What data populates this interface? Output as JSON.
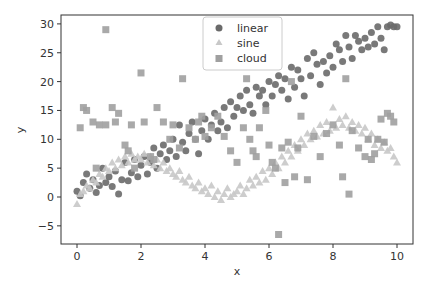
{
  "chart_data": {
    "type": "scatter",
    "title": "",
    "xlabel": "x",
    "ylabel": "y",
    "xlim": [
      -0.5,
      10.5
    ],
    "ylim": [
      -8,
      32
    ],
    "xticks": [
      0,
      2,
      4,
      6,
      8,
      10
    ],
    "yticks": [
      -5,
      0,
      5,
      10,
      15,
      20,
      25,
      30
    ],
    "grid": false,
    "legend_position": "upper center",
    "series": [
      {
        "name": "linear",
        "marker": "circle",
        "color": "#6a6a6a",
        "points": [
          [
            0.0,
            1.0
          ],
          [
            0.1,
            0.2
          ],
          [
            0.2,
            2.5
          ],
          [
            0.3,
            4.0
          ],
          [
            0.4,
            1.5
          ],
          [
            0.5,
            3.0
          ],
          [
            0.6,
            0.8
          ],
          [
            0.7,
            2.0
          ],
          [
            0.8,
            5.0
          ],
          [
            0.9,
            2.5
          ],
          [
            1.0,
            3.5
          ],
          [
            1.1,
            1.8
          ],
          [
            1.2,
            4.5
          ],
          [
            1.3,
            0.5
          ],
          [
            1.4,
            3.0
          ],
          [
            1.5,
            6.0
          ],
          [
            1.6,
            2.8
          ],
          [
            1.7,
            4.2
          ],
          [
            1.8,
            6.5
          ],
          [
            1.9,
            3.5
          ],
          [
            2.0,
            5.5
          ],
          [
            2.1,
            7.0
          ],
          [
            2.2,
            4.0
          ],
          [
            2.3,
            6.0
          ],
          [
            2.4,
            8.5
          ],
          [
            2.5,
            5.0
          ],
          [
            2.6,
            7.5
          ],
          [
            2.7,
            9.0
          ],
          [
            2.8,
            6.5
          ],
          [
            2.9,
            8.0
          ],
          [
            3.0,
            10.0
          ],
          [
            3.1,
            7.0
          ],
          [
            3.2,
            12.5
          ],
          [
            3.3,
            9.5
          ],
          [
            3.4,
            8.0
          ],
          [
            3.5,
            11.0
          ],
          [
            3.6,
            13.0
          ],
          [
            3.7,
            10.0
          ],
          [
            3.8,
            7.5
          ],
          [
            3.9,
            11.5
          ],
          [
            4.0,
            13.5
          ],
          [
            4.1,
            10.0
          ],
          [
            4.2,
            12.5
          ],
          [
            4.3,
            14.5
          ],
          [
            4.4,
            11.5
          ],
          [
            4.5,
            13.0
          ],
          [
            4.6,
            15.5
          ],
          [
            4.7,
            12.0
          ],
          [
            4.8,
            16.5
          ],
          [
            4.9,
            14.0
          ],
          [
            5.0,
            15.5
          ],
          [
            5.1,
            17.5
          ],
          [
            5.2,
            15.0
          ],
          [
            5.3,
            18.5
          ],
          [
            5.4,
            16.0
          ],
          [
            5.5,
            14.5
          ],
          [
            5.6,
            19.0
          ],
          [
            5.7,
            17.5
          ],
          [
            5.8,
            18.5
          ],
          [
            5.9,
            16.0
          ],
          [
            6.0,
            20.0
          ],
          [
            6.1,
            17.5
          ],
          [
            6.2,
            19.5
          ],
          [
            6.3,
            21.0
          ],
          [
            6.4,
            18.5
          ],
          [
            6.5,
            20.5
          ],
          [
            6.6,
            17.0
          ],
          [
            6.7,
            22.5
          ],
          [
            6.8,
            19.0
          ],
          [
            6.9,
            22.0
          ],
          [
            7.0,
            20.5
          ],
          [
            7.1,
            17.5
          ],
          [
            7.2,
            24.0
          ],
          [
            7.3,
            21.0
          ],
          [
            7.4,
            25.0
          ],
          [
            7.5,
            23.0
          ],
          [
            7.6,
            19.5
          ],
          [
            7.7,
            23.5
          ],
          [
            7.8,
            21.5
          ],
          [
            7.9,
            24.5
          ],
          [
            8.0,
            22.5
          ],
          [
            8.1,
            26.5
          ],
          [
            8.2,
            25.5
          ],
          [
            8.3,
            23.5
          ],
          [
            8.4,
            28.0
          ],
          [
            8.5,
            26.0
          ],
          [
            8.6,
            24.0
          ],
          [
            8.7,
            28.0
          ],
          [
            8.8,
            27.0
          ],
          [
            8.9,
            25.5
          ],
          [
            9.0,
            27.5
          ],
          [
            9.1,
            26.0
          ],
          [
            9.2,
            28.5
          ],
          [
            9.3,
            26.5
          ],
          [
            9.4,
            29.5
          ],
          [
            9.5,
            27.5
          ],
          [
            9.6,
            25.5
          ],
          [
            9.7,
            29.5
          ],
          [
            9.8,
            29.8
          ],
          [
            9.9,
            29.5
          ],
          [
            10.0,
            29.5
          ]
        ]
      },
      {
        "name": "sine",
        "marker": "triangle",
        "color": "#c8c8c8",
        "points": [
          [
            0.0,
            -1.2
          ],
          [
            0.1,
            0.5
          ],
          [
            0.2,
            1.0
          ],
          [
            0.3,
            2.0
          ],
          [
            0.4,
            1.5
          ],
          [
            0.5,
            3.0
          ],
          [
            0.6,
            2.5
          ],
          [
            0.7,
            4.0
          ],
          [
            0.8,
            3.5
          ],
          [
            0.9,
            5.0
          ],
          [
            1.0,
            4.5
          ],
          [
            1.1,
            6.0
          ],
          [
            1.2,
            5.0
          ],
          [
            1.3,
            6.5
          ],
          [
            1.4,
            5.5
          ],
          [
            1.5,
            7.0
          ],
          [
            1.6,
            6.0
          ],
          [
            1.7,
            7.5
          ],
          [
            1.8,
            6.5
          ],
          [
            1.9,
            7.0
          ],
          [
            2.0,
            6.5
          ],
          [
            2.1,
            7.5
          ],
          [
            2.2,
            6.0
          ],
          [
            2.3,
            7.0
          ],
          [
            2.4,
            5.5
          ],
          [
            2.5,
            6.5
          ],
          [
            2.6,
            5.0
          ],
          [
            2.7,
            6.0
          ],
          [
            2.8,
            4.5
          ],
          [
            2.9,
            5.0
          ],
          [
            3.0,
            4.0
          ],
          [
            3.1,
            3.5
          ],
          [
            3.2,
            4.5
          ],
          [
            3.3,
            3.0
          ],
          [
            3.4,
            2.5
          ],
          [
            3.5,
            3.5
          ],
          [
            3.6,
            2.0
          ],
          [
            3.7,
            1.5
          ],
          [
            3.8,
            2.5
          ],
          [
            3.9,
            1.0
          ],
          [
            4.0,
            1.5
          ],
          [
            4.1,
            0.5
          ],
          [
            4.2,
            2.0
          ],
          [
            4.3,
            0.0
          ],
          [
            4.4,
            1.0
          ],
          [
            4.5,
            -0.5
          ],
          [
            4.6,
            0.5
          ],
          [
            4.7,
            1.5
          ],
          [
            4.8,
            0.0
          ],
          [
            4.9,
            0.5
          ],
          [
            5.0,
            1.0
          ],
          [
            5.1,
            2.0
          ],
          [
            5.2,
            0.5
          ],
          [
            5.3,
            1.5
          ],
          [
            5.4,
            3.0
          ],
          [
            5.5,
            2.0
          ],
          [
            5.6,
            3.5
          ],
          [
            5.7,
            2.5
          ],
          [
            5.8,
            4.5
          ],
          [
            5.9,
            3.0
          ],
          [
            6.0,
            5.0
          ],
          [
            6.1,
            4.0
          ],
          [
            6.2,
            6.0
          ],
          [
            6.3,
            5.0
          ],
          [
            6.4,
            7.0
          ],
          [
            6.5,
            6.0
          ],
          [
            6.6,
            8.0
          ],
          [
            6.7,
            7.0
          ],
          [
            6.8,
            9.0
          ],
          [
            6.9,
            8.0
          ],
          [
            7.0,
            10.0
          ],
          [
            7.1,
            9.0
          ],
          [
            7.2,
            11.0
          ],
          [
            7.3,
            10.0
          ],
          [
            7.4,
            11.5
          ],
          [
            7.5,
            10.5
          ],
          [
            7.6,
            12.5
          ],
          [
            7.7,
            11.0
          ],
          [
            7.8,
            13.0
          ],
          [
            7.9,
            11.5
          ],
          [
            8.0,
            15.5
          ],
          [
            8.1,
            12.0
          ],
          [
            8.2,
            13.5
          ],
          [
            8.3,
            12.5
          ],
          [
            8.4,
            14.0
          ],
          [
            8.5,
            12.0
          ],
          [
            8.6,
            13.0
          ],
          [
            8.7,
            11.5
          ],
          [
            8.8,
            12.5
          ],
          [
            8.9,
            11.0
          ],
          [
            9.0,
            12.0
          ],
          [
            9.1,
            10.0
          ],
          [
            9.2,
            11.0
          ],
          [
            9.3,
            9.0
          ],
          [
            9.4,
            10.0
          ],
          [
            9.5,
            8.5
          ],
          [
            9.6,
            9.5
          ],
          [
            9.7,
            8.0
          ],
          [
            9.8,
            8.5
          ],
          [
            9.9,
            7.0
          ],
          [
            10.0,
            6.0
          ]
        ]
      },
      {
        "name": "cloud",
        "marker": "square",
        "color": "#a0a0a0",
        "points": [
          [
            0.1,
            12.0
          ],
          [
            0.2,
            15.5
          ],
          [
            0.3,
            15.0
          ],
          [
            0.5,
            13.0
          ],
          [
            0.6,
            5.0
          ],
          [
            0.7,
            12.5
          ],
          [
            0.9,
            12.5
          ],
          [
            0.9,
            29.0
          ],
          [
            1.1,
            15.5
          ],
          [
            1.2,
            13.0
          ],
          [
            1.3,
            14.5
          ],
          [
            1.5,
            9.0
          ],
          [
            1.6,
            8.0
          ],
          [
            1.7,
            12.5
          ],
          [
            1.8,
            5.0
          ],
          [
            2.0,
            21.5
          ],
          [
            2.1,
            13.0
          ],
          [
            2.3,
            7.0
          ],
          [
            2.4,
            6.5
          ],
          [
            2.5,
            15.5
          ],
          [
            2.7,
            13.0
          ],
          [
            2.9,
            10.0
          ],
          [
            3.0,
            12.5
          ],
          [
            3.2,
            8.5
          ],
          [
            3.3,
            20.5
          ],
          [
            3.5,
            12.0
          ],
          [
            3.7,
            10.0
          ],
          [
            3.8,
            13.0
          ],
          [
            3.9,
            14.0
          ],
          [
            4.0,
            10.5
          ],
          [
            4.2,
            12.0
          ],
          [
            4.4,
            14.0
          ],
          [
            4.6,
            10.5
          ],
          [
            4.8,
            8.0
          ],
          [
            5.0,
            6.0
          ],
          [
            5.2,
            12.0
          ],
          [
            5.3,
            20.5
          ],
          [
            5.4,
            10.0
          ],
          [
            5.5,
            8.0
          ],
          [
            5.6,
            7.0
          ],
          [
            5.7,
            12.0
          ],
          [
            5.9,
            15.0
          ],
          [
            6.0,
            9.0
          ],
          [
            6.1,
            6.0
          ],
          [
            6.2,
            5.0
          ],
          [
            6.3,
            -6.5
          ],
          [
            6.4,
            8.5
          ],
          [
            6.5,
            2.5
          ],
          [
            6.6,
            9.5
          ],
          [
            6.7,
            20.0
          ],
          [
            6.8,
            3.5
          ],
          [
            6.9,
            8.5
          ],
          [
            7.0,
            14.0
          ],
          [
            7.2,
            3.0
          ],
          [
            7.4,
            10.5
          ],
          [
            7.6,
            7.0
          ],
          [
            7.8,
            11.0
          ],
          [
            8.0,
            12.5
          ],
          [
            8.2,
            9.0
          ],
          [
            8.3,
            3.5
          ],
          [
            8.4,
            20.5
          ],
          [
            8.5,
            0.5
          ],
          [
            8.6,
            11.5
          ],
          [
            8.8,
            8.5
          ],
          [
            9.0,
            7.0
          ],
          [
            9.1,
            10.0
          ],
          [
            9.2,
            6.5
          ],
          [
            9.3,
            7.5
          ],
          [
            9.4,
            10.0
          ],
          [
            9.5,
            13.5
          ],
          [
            9.6,
            9.5
          ],
          [
            9.7,
            14.5
          ],
          [
            9.8,
            14.0
          ],
          [
            9.9,
            13.0
          ]
        ]
      }
    ]
  },
  "legend": {
    "items": [
      {
        "label": "linear"
      },
      {
        "label": "sine"
      },
      {
        "label": "cloud"
      }
    ]
  },
  "axes": {
    "xlabel": "x",
    "ylabel": "y",
    "xtick_labels": [
      "0",
      "2",
      "4",
      "6",
      "8",
      "10"
    ],
    "ytick_labels": [
      "−5",
      "0",
      "5",
      "10",
      "15",
      "20",
      "25",
      "30"
    ]
  }
}
